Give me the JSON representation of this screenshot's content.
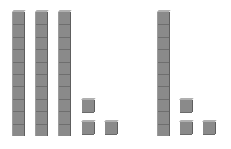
{
  "figure": {
    "colors": {
      "block": "#8a8a8a",
      "edge": "#5e5e5e",
      "top": "#b0b0b0",
      "background": "#ffffff"
    },
    "groups": [
      {
        "name": "left-group",
        "tens_rods": 3,
        "unit_cubes": 3,
        "value": 33,
        "rods": [
          {
            "x": 13
          },
          {
            "x": 36
          },
          {
            "x": 59
          }
        ],
        "cubes": [
          {
            "x": 82,
            "y": 100
          },
          {
            "x": 82,
            "y": 122
          },
          {
            "x": 105,
            "y": 122
          }
        ]
      },
      {
        "name": "right-group",
        "tens_rods": 1,
        "unit_cubes": 3,
        "value": 13,
        "rods": [
          {
            "x": 158
          }
        ],
        "cubes": [
          {
            "x": 180,
            "y": 100
          },
          {
            "x": 180,
            "y": 122
          },
          {
            "x": 203,
            "y": 122
          }
        ]
      }
    ],
    "rod_segments": 10,
    "rod_top_y": 12,
    "rod_height": 124
  }
}
